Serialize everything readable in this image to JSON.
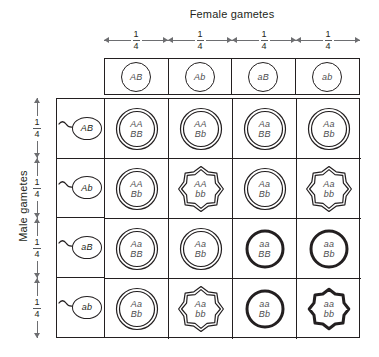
{
  "diagram": {
    "type": "punnett-square",
    "female_axis_label": "Female gametes",
    "male_axis_label": "Male gametes",
    "gamete_fraction": {
      "numerator": "1",
      "denominator": "4"
    }
  },
  "colors": {
    "line": "#231f20",
    "arrow": "#6d6e71",
    "text": "#231f20",
    "genotype_text": "#4d4d4f",
    "background": "#ffffff"
  },
  "female_gametes": [
    {
      "label": "AB"
    },
    {
      "label": "Ab"
    },
    {
      "label": "aB"
    },
    {
      "label": "ab"
    }
  ],
  "male_gametes": [
    {
      "label": "AB"
    },
    {
      "label": "Ab"
    },
    {
      "label": "aB"
    },
    {
      "label": "ab"
    }
  ],
  "column_fractions": [
    {
      "numerator": "1",
      "denominator": "4"
    },
    {
      "numerator": "1",
      "denominator": "4"
    },
    {
      "numerator": "1",
      "denominator": "4"
    },
    {
      "numerator": "1",
      "denominator": "4"
    }
  ],
  "row_fractions": [
    {
      "numerator": "1",
      "denominator": "4"
    },
    {
      "numerator": "1",
      "denominator": "4"
    },
    {
      "numerator": "1",
      "denominator": "4"
    },
    {
      "numerator": "1",
      "denominator": "4"
    }
  ],
  "offspring": [
    {
      "genotype": "AA\nBB",
      "gene1": "AA",
      "gene2": "BB",
      "shape": "round",
      "outline": "thin-double"
    },
    {
      "genotype": "AA\nBb",
      "gene1": "AA",
      "gene2": "Bb",
      "shape": "round",
      "outline": "thin-double"
    },
    {
      "genotype": "Aa\nBB",
      "gene1": "Aa",
      "gene2": "BB",
      "shape": "round",
      "outline": "thin-double"
    },
    {
      "genotype": "Aa\nBb",
      "gene1": "Aa",
      "gene2": "Bb",
      "shape": "round",
      "outline": "thin-double"
    },
    {
      "genotype": "AA\nBb",
      "gene1": "AA",
      "gene2": "Bb",
      "shape": "round",
      "outline": "thin-double"
    },
    {
      "genotype": "AA\nbb",
      "gene1": "AA",
      "gene2": "bb",
      "shape": "wrinkled",
      "outline": "thin-double"
    },
    {
      "genotype": "Aa\nBb",
      "gene1": "Aa",
      "gene2": "Bb",
      "shape": "round",
      "outline": "thin-double"
    },
    {
      "genotype": "Aa\nbb",
      "gene1": "Aa",
      "gene2": "bb",
      "shape": "wrinkled",
      "outline": "thin-double"
    },
    {
      "genotype": "Aa\nBB",
      "gene1": "Aa",
      "gene2": "BB",
      "shape": "round",
      "outline": "thin-double"
    },
    {
      "genotype": "Aa\nBb",
      "gene1": "Aa",
      "gene2": "Bb",
      "shape": "round",
      "outline": "thin-double"
    },
    {
      "genotype": "aa\nBB",
      "gene1": "aa",
      "gene2": "BB",
      "shape": "round",
      "outline": "thick-single"
    },
    {
      "genotype": "aa\nBb",
      "gene1": "aa",
      "gene2": "Bb",
      "shape": "round",
      "outline": "thick-single"
    },
    {
      "genotype": "Aa\nBb",
      "gene1": "Aa",
      "gene2": "Bb",
      "shape": "round",
      "outline": "thin-double"
    },
    {
      "genotype": "Aa\nbb",
      "gene1": "Aa",
      "gene2": "bb",
      "shape": "wrinkled",
      "outline": "thin-double"
    },
    {
      "genotype": "aa\nBb",
      "gene1": "aa",
      "gene2": "Bb",
      "shape": "round",
      "outline": "thick-single"
    },
    {
      "genotype": "aa\nbb",
      "gene1": "aa",
      "gene2": "bb",
      "shape": "wrinkled",
      "outline": "thick-single"
    }
  ]
}
